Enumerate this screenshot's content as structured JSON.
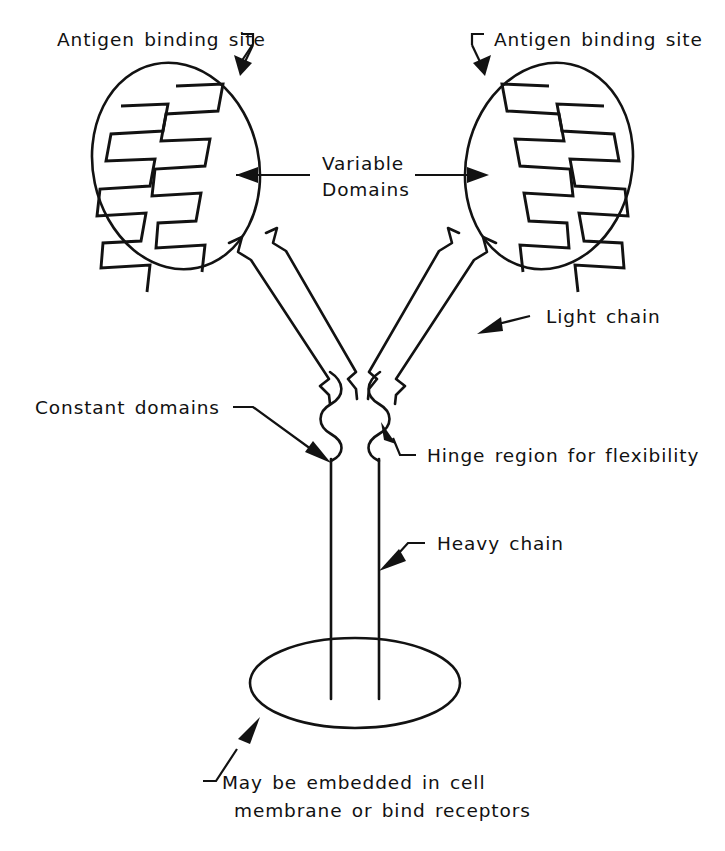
{
  "figure": {
    "style": "hand-drawn line art, black ink on white",
    "background_color": "#ffffff",
    "ink_color": "#121212"
  },
  "labels": {
    "antigen_binding_site_left": "Antigen binding site",
    "antigen_binding_site_right": "Antigen binding site",
    "variable_domains_line1": "Variable",
    "variable_domains_line2": "Domains",
    "light_chain": "Light chain",
    "constant_domains": "Constant domains",
    "hinge_region": "Hinge region for flexibility",
    "heavy_chain": "Heavy chain",
    "membrane_note_line1": "May be embedded in cell",
    "membrane_note_line2": "membrane or bind receptors"
  },
  "parts": [
    {
      "id": "antigen-binding-site-left",
      "label": "Antigen binding site",
      "annotation_side": "left",
      "pointer": "arrow pointing down-right to upper-right edge of left oval"
    },
    {
      "id": "antigen-binding-site-right",
      "label": "Antigen binding site",
      "annotation_side": "right",
      "pointer": "arrow pointing down-left to upper-left edge of right oval"
    },
    {
      "id": "variable-domains",
      "label": "Variable Domains",
      "annotation_side": "center",
      "pointer": "two horizontal arrows pointing outward into each oval's zigzag region"
    },
    {
      "id": "light-chain",
      "label": "Light chain",
      "annotation_side": "right",
      "pointer": "arrow pointing down-left to right arm band"
    },
    {
      "id": "constant-domains",
      "label": "Constant domains",
      "annotation_side": "left",
      "pointer": "arrow pointing down-right to left hinge squiggle"
    },
    {
      "id": "hinge-region",
      "label": "Hinge region for flexibility",
      "annotation_side": "right",
      "pointer": "arrow pointing up-left to right hinge squiggle"
    },
    {
      "id": "heavy-chain",
      "label": "Heavy chain",
      "annotation_side": "right",
      "pointer": "arrow pointing down-left to right stem line"
    },
    {
      "id": "membrane-note",
      "label": "May be embedded in cell membrane or bind receptors",
      "annotation_side": "bottom",
      "pointer": "arrow pointing up-right to lower-left edge of base ellipse"
    }
  ],
  "shapes": {
    "left_oval": {
      "cx": 176,
      "cy": 165,
      "rx": 84,
      "ry": 103,
      "rotation_deg": -12
    },
    "right_oval": {
      "cx": 549,
      "cy": 165,
      "rx": 84,
      "ry": 103,
      "rotation_deg": 12
    },
    "base_ellipse": {
      "cx": 355,
      "cy": 683,
      "rx": 105,
      "ry": 45,
      "rotation_deg": 0
    },
    "stem_lines_x": [
      331,
      379
    ],
    "stem_top_y": 455,
    "stem_bottom_y": 700,
    "zigzag_teeth_per_chain": 8
  }
}
